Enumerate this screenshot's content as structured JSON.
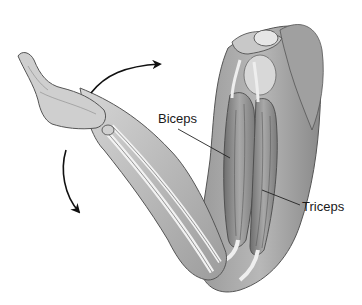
{
  "figure": {
    "labels": {
      "biceps": "Biceps",
      "triceps": "Triceps"
    },
    "arrows": [
      {
        "name": "flexion-arrow",
        "direction": "curved up-right"
      },
      {
        "name": "extension-arrow",
        "direction": "curved down"
      }
    ],
    "colors": {
      "skin_light": "#d9d9d9",
      "skin_mid": "#b5b5b5",
      "skin_dark": "#7a7a7a",
      "muscle": "#8c8c8c",
      "bone": "#ececec",
      "outline": "#3a3a3a",
      "text": "#1a1a1a",
      "leader": "#2a2a2a"
    }
  }
}
